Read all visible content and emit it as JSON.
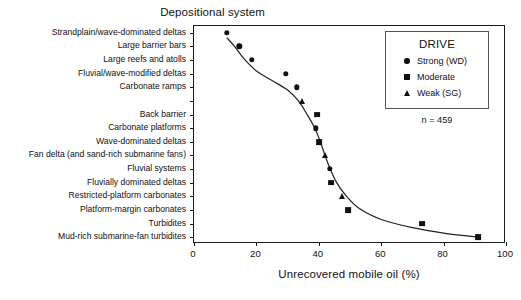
{
  "chart_data": {
    "type": "scatter",
    "title": "",
    "ylabel": "Depositional system",
    "xlabel": "Unrecovered mobile oil (%)",
    "xlim": [
      0,
      100
    ],
    "xticks": [
      0,
      20,
      40,
      60,
      80,
      100
    ],
    "grid": false,
    "annotation": "n = 459",
    "legend": {
      "title": "DRIVE",
      "position": "upper-right",
      "entries": [
        {
          "label": "Strong (WD)",
          "marker": "circle"
        },
        {
          "label": "Moderate",
          "marker": "square"
        },
        {
          "label": "Weak (SG)",
          "marker": "triangle"
        }
      ]
    },
    "categories": [
      "Strandplain/wave-dominated deltas",
      "Large barrier bars",
      "Large reefs and atolls",
      "Fluvial/wave-modified deltas",
      "Carbonate ramps",
      "Back barrier",
      "Carbonate platforms",
      "Wave-dominated deltas",
      "Fan delta (and sand-rich submarine fans)",
      "Fluvial systems",
      "Fluvially dominated deltas",
      "Restricted-platform carbonates",
      "Platform-margin carbonates",
      "Turbidites",
      "Mud-rich submarine-fan turbidites"
    ],
    "points": [
      {
        "category": "Strandplain/wave-dominated deltas",
        "value": 10.5,
        "marker": "circle"
      },
      {
        "category": "Large barrier bars",
        "value": 14.5,
        "marker": "circle"
      },
      {
        "category": "Large reefs and atolls",
        "value": 18.5,
        "marker": "circle"
      },
      {
        "category": "Fluvial/wave-modified deltas",
        "value": 29.5,
        "marker": "circle"
      },
      {
        "category": "Carbonate ramps",
        "value": 33.0,
        "marker": "circle"
      },
      {
        "category": "Carbonate ramps",
        "value": 34.5,
        "marker": "triangle"
      },
      {
        "category": "Back barrier",
        "value": 39.5,
        "marker": "square"
      },
      {
        "category": "Carbonate platforms",
        "value": 39.0,
        "marker": "circle"
      },
      {
        "category": "Wave-dominated deltas",
        "value": 40.0,
        "marker": "square"
      },
      {
        "category": "Fan delta (and sand-rich submarine fans)",
        "value": 42.0,
        "marker": "triangle"
      },
      {
        "category": "Fluvial systems",
        "value": 43.5,
        "marker": "circle"
      },
      {
        "category": "Fluvially dominated deltas",
        "value": 44.0,
        "marker": "square"
      },
      {
        "category": "Restricted-platform carbonates",
        "value": 47.5,
        "marker": "triangle"
      },
      {
        "category": "Platform-margin carbonates",
        "value": 49.5,
        "marker": "square"
      },
      {
        "category": "Turbidites",
        "value": 73.0,
        "marker": "square"
      },
      {
        "category": "Mud-rich submarine-fan turbidites",
        "value": 91.0,
        "marker": "square"
      }
    ],
    "trend_line": [
      [
        10.5,
        0.35
      ],
      [
        13.0,
        1.0
      ],
      [
        16.0,
        1.9
      ],
      [
        20.0,
        2.8
      ],
      [
        25.0,
        3.5
      ],
      [
        30.0,
        4.2
      ],
      [
        33.5,
        5.0
      ],
      [
        36.0,
        5.9
      ],
      [
        38.5,
        6.9
      ],
      [
        40.5,
        8.0
      ],
      [
        42.0,
        9.0
      ],
      [
        43.5,
        9.9
      ],
      [
        45.5,
        10.9
      ],
      [
        48.5,
        11.9
      ],
      [
        53.0,
        12.9
      ],
      [
        60.0,
        13.7
      ],
      [
        70.0,
        14.3
      ],
      [
        80.0,
        14.7
      ],
      [
        91.0,
        15.0
      ]
    ]
  }
}
